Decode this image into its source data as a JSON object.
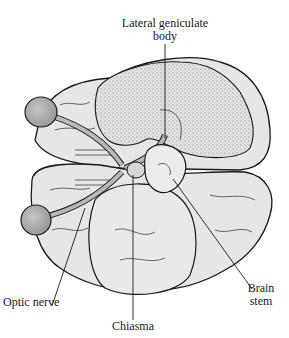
{
  "figure": {
    "type": "anatomical-diagram",
    "labels": {
      "lgb_line1": "Lateral geniculate",
      "lgb_line2": "body",
      "optic_nerve": "Optic nerve",
      "chiasma": "Chiasma",
      "brain_stem_line1": "Brain",
      "brain_stem_line2": "stem"
    },
    "colors": {
      "outline": "#1a1a1a",
      "brain_fill": "#e4e4e4",
      "stipple_fill": "#d2d2d2",
      "eyeball_fill": "#a8a8a8",
      "nerve_fill": "#b8b8b8",
      "background": "#ffffff"
    }
  }
}
